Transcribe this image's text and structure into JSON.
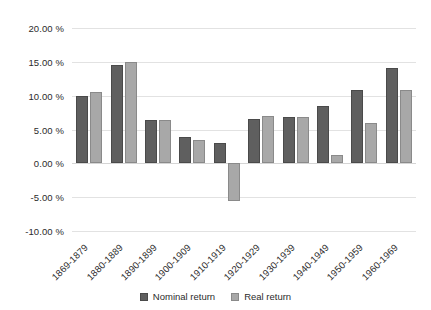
{
  "chart_data": {
    "type": "bar",
    "title": "",
    "xlabel": "",
    "ylabel": "",
    "ylim": [
      -10,
      20
    ],
    "ytick_step": 5,
    "grid": true,
    "legend_position": "bottom",
    "ytick_labels": [
      "20.00 %",
      "15.00 %",
      "10.00 %",
      "5.00 %",
      "0.00 %",
      "-5.00 %",
      "-10.00 %"
    ],
    "yticks": [
      20,
      15,
      10,
      5,
      0,
      -5,
      -10
    ],
    "categories": [
      "1869-1879",
      "1880-1889",
      "1890-1899",
      "1900-1909",
      "1910-1919",
      "1920-1929",
      "1930-1939",
      "1940-1949",
      "1950-1959",
      "1960-1969"
    ],
    "series": [
      {
        "name": "Nominal return",
        "color": "#5f5f5f",
        "values": [
          10.0,
          14.6,
          6.4,
          3.9,
          3.0,
          6.5,
          6.8,
          8.4,
          10.8,
          14.1
        ]
      },
      {
        "name": "Real return",
        "color": "#a8a8a8",
        "values": [
          10.6,
          15.0,
          6.4,
          3.4,
          -5.5,
          7.0,
          6.9,
          1.3,
          6.0,
          10.8
        ]
      }
    ]
  },
  "legend": {
    "items": [
      {
        "label": "Nominal return"
      },
      {
        "label": "Real return"
      }
    ]
  }
}
